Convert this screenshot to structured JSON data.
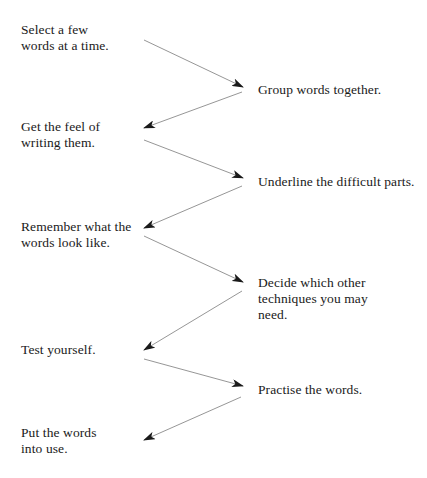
{
  "diagram": {
    "type": "zigzag-flow",
    "line_color": "#8a8a8a",
    "arrowhead_color": "#1a1a1a",
    "text_color": "#1a1a1a",
    "steps": [
      {
        "id": 1,
        "column": "left",
        "text": "Select a few\nwords at a time."
      },
      {
        "id": 2,
        "column": "right",
        "text": "Group words together."
      },
      {
        "id": 3,
        "column": "left",
        "text": "Get the feel of\nwriting them."
      },
      {
        "id": 4,
        "column": "right",
        "text": "Underline the difficult parts."
      },
      {
        "id": 5,
        "column": "left",
        "text": "Remember what the\nwords look like."
      },
      {
        "id": 6,
        "column": "right",
        "text": "Decide which other\ntechniques you may\nneed."
      },
      {
        "id": 7,
        "column": "left",
        "text": "Test yourself."
      },
      {
        "id": 8,
        "column": "right",
        "text": "Practise the words."
      },
      {
        "id": 9,
        "column": "left",
        "text": "Put the words\ninto use."
      }
    ],
    "arrows": [
      {
        "from": 1,
        "to": 2
      },
      {
        "from": 2,
        "to": 3
      },
      {
        "from": 3,
        "to": 4
      },
      {
        "from": 4,
        "to": 5
      },
      {
        "from": 5,
        "to": 6
      },
      {
        "from": 6,
        "to": 7
      },
      {
        "from": 7,
        "to": 8
      },
      {
        "from": 8,
        "to": 9
      }
    ]
  }
}
